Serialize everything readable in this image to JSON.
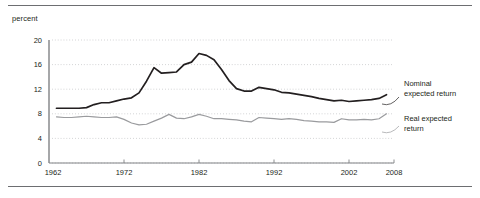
{
  "figure": {
    "axis_unit_label": "percent",
    "top_rule_color": "#6d6e71",
    "bottom_rule_color": "#6d6e71"
  },
  "legend": {
    "nominal_label": "Nominal\nexpected return",
    "real_label": "Real expected\nreturn"
  },
  "axes": {
    "y_ticks": [
      "0",
      "4",
      "8",
      "12",
      "16",
      "20"
    ],
    "x_ticks": [
      "1962",
      "1972",
      "1982",
      "1992",
      "2002",
      "2008"
    ]
  },
  "chart_data": {
    "type": "line",
    "title": "",
    "subtitle": "",
    "xlabel": "",
    "ylabel": "percent",
    "ylim": [
      0,
      20
    ],
    "xlim": [
      1962,
      2008
    ],
    "yticks": [
      0,
      4,
      8,
      12,
      16,
      20
    ],
    "xticks": [
      1962,
      1972,
      1982,
      1992,
      2002,
      2008
    ],
    "grid": "horizontal-dotted",
    "legend_position": "right-inline",
    "x": [
      1963,
      1964,
      1965,
      1966,
      1967,
      1968,
      1969,
      1970,
      1971,
      1972,
      1973,
      1974,
      1975,
      1976,
      1977,
      1978,
      1979,
      1980,
      1981,
      1982,
      1983,
      1984,
      1985,
      1986,
      1987,
      1988,
      1989,
      1990,
      1991,
      1992,
      1993,
      1994,
      1995,
      1996,
      1997,
      1998,
      1999,
      2000,
      2001,
      2002,
      2003,
      2004,
      2005,
      2006,
      2007
    ],
    "series": [
      {
        "name": "Nominal expected return",
        "color": "#231f20",
        "values": [
          8.9,
          8.9,
          8.9,
          8.9,
          9.0,
          9.5,
          9.8,
          9.8,
          10.1,
          10.4,
          10.6,
          11.4,
          13.3,
          15.5,
          14.6,
          14.7,
          14.8,
          16.0,
          16.4,
          17.8,
          17.5,
          16.8,
          15.2,
          13.4,
          12.1,
          11.7,
          11.7,
          12.3,
          12.1,
          11.9,
          11.5,
          11.4,
          11.2,
          11.0,
          10.8,
          10.5,
          10.3,
          10.1,
          10.2,
          10.0,
          10.1,
          10.2,
          10.3,
          10.5,
          11.1
        ]
      },
      {
        "name": "Real expected return",
        "color": "#9a9b9e",
        "values": [
          7.5,
          7.4,
          7.4,
          7.5,
          7.6,
          7.5,
          7.4,
          7.4,
          7.5,
          7.1,
          6.5,
          6.2,
          6.3,
          6.8,
          7.3,
          7.9,
          7.3,
          7.2,
          7.5,
          7.9,
          7.6,
          7.2,
          7.2,
          7.1,
          7.0,
          6.8,
          6.7,
          7.4,
          7.3,
          7.2,
          7.1,
          7.2,
          7.1,
          6.9,
          6.8,
          6.7,
          6.7,
          6.6,
          7.2,
          7.0,
          7.0,
          7.1,
          7.0,
          7.2,
          8.0
        ]
      }
    ]
  }
}
